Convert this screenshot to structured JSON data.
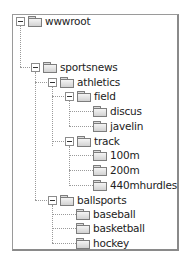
{
  "tree": {
    "nodes": [
      {
        "label": "wwwroot",
        "depth": 0,
        "expanded": true,
        "has_children": true
      },
      {
        "label": "sportsnews",
        "depth": 1,
        "expanded": true,
        "has_children": true
      },
      {
        "label": "athletics",
        "depth": 2,
        "expanded": true,
        "has_children": true
      },
      {
        "label": "field",
        "depth": 3,
        "expanded": true,
        "has_children": true
      },
      {
        "label": "discus",
        "depth": 4,
        "expanded": false,
        "has_children": false
      },
      {
        "label": "javelin",
        "depth": 4,
        "expanded": false,
        "has_children": false
      },
      {
        "label": "track",
        "depth": 3,
        "expanded": true,
        "has_children": true
      },
      {
        "label": "100m",
        "depth": 4,
        "expanded": false,
        "has_children": false
      },
      {
        "label": "200m",
        "depth": 4,
        "expanded": false,
        "has_children": false
      },
      {
        "label": "440mhurdles",
        "depth": 4,
        "expanded": false,
        "has_children": false
      },
      {
        "label": "ballsports",
        "depth": 2,
        "expanded": true,
        "has_children": true
      },
      {
        "label": "baseball",
        "depth": 3,
        "expanded": false,
        "has_children": false
      },
      {
        "label": "basketball",
        "depth": 3,
        "expanded": false,
        "has_children": false
      },
      {
        "label": "hockey",
        "depth": 3,
        "expanded": false,
        "has_children": false
      }
    ]
  },
  "icons": {
    "expanded": "minus-box",
    "folder": "folder-closed"
  },
  "colors": {
    "line": "#9a9a9a",
    "text": "#222222",
    "folder_fill": "#dcdcdc",
    "border": "#8a8a8a"
  }
}
